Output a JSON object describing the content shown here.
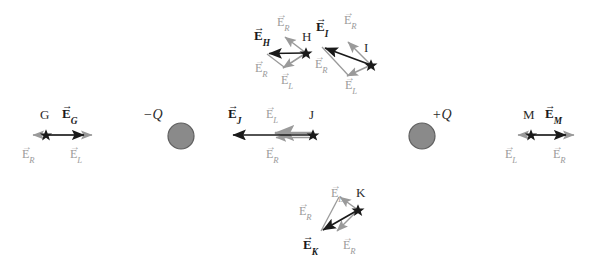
{
  "figure": {
    "type": "physics-vector-diagram",
    "background_color": "#ffffff",
    "black_color": "#1a1a1a",
    "gray_color": "#9a9a9a",
    "charge_fill_color": "#8a8a8a",
    "charge_border_color": "#5f5f5f"
  },
  "charges": [
    {
      "name": "negative-charge",
      "label": "−Q",
      "cx": 181,
      "cy": 136,
      "r": 13,
      "label_x": 143,
      "label_y": 110
    },
    {
      "name": "positive-charge",
      "label": "+Q",
      "cx": 422,
      "cy": 136,
      "r": 13,
      "label_x": 433,
      "label_y": 110
    }
  ],
  "points": [
    {
      "id": "G",
      "point_label": "G",
      "resultant_label": {
        "base": "E",
        "sub": "G"
      },
      "component_labels": [
        {
          "base": "E",
          "sub": "R"
        },
        {
          "base": "E",
          "sub": "L"
        }
      ],
      "star_x": 46,
      "star_y": 135
    },
    {
      "id": "H",
      "point_label": "H",
      "resultant_label": {
        "base": "E",
        "sub": "H"
      },
      "component_labels": [
        {
          "base": "E",
          "sub": "R"
        },
        {
          "base": "E",
          "sub": "L"
        },
        {
          "base": "E",
          "sub": "R"
        }
      ],
      "star_x": 306,
      "star_y": 53
    },
    {
      "id": "I",
      "point_label": "I",
      "resultant_label": {
        "base": "E",
        "sub": "I"
      },
      "component_labels": [
        {
          "base": "E",
          "sub": "R"
        },
        {
          "base": "E",
          "sub": "L"
        },
        {
          "base": "E",
          "sub": "R"
        }
      ],
      "star_x": 371,
      "star_y": 65
    },
    {
      "id": "J",
      "point_label": "J",
      "resultant_label": {
        "base": "E",
        "sub": "J"
      },
      "component_labels": [
        {
          "base": "E",
          "sub": "L"
        },
        {
          "base": "E",
          "sub": "R"
        }
      ],
      "star_x": 313,
      "star_y": 135
    },
    {
      "id": "K",
      "point_label": "K",
      "resultant_label": {
        "base": "E",
        "sub": "K"
      },
      "component_labels": [
        {
          "base": "E",
          "sub": "L"
        },
        {
          "base": "E",
          "sub": "R"
        },
        {
          "base": "E",
          "sub": "R"
        }
      ],
      "star_x": 358,
      "star_y": 210
    },
    {
      "id": "M",
      "point_label": "M",
      "resultant_label": {
        "base": "E",
        "sub": "M"
      },
      "component_labels": [
        {
          "base": "E",
          "sub": "L"
        },
        {
          "base": "E",
          "sub": "R"
        }
      ],
      "star_x": 531,
      "star_y": 135
    }
  ],
  "labels": {
    "g_point": "G",
    "g_resultant_base": "E",
    "g_resultant_sub": "G",
    "g_er": "E",
    "g_er_sub": "R",
    "g_el": "E",
    "g_el_sub": "L",
    "h_point": "H",
    "h_resultant_base": "E",
    "h_resultant_sub": "H",
    "h_er_top": "E",
    "h_er_top_sub": "R",
    "h_er_left": "E",
    "h_er_left_sub": "R",
    "h_el": "E",
    "h_el_sub": "L",
    "i_point": "I",
    "i_resultant_base": "E",
    "i_resultant_sub": "I",
    "i_er_top": "E",
    "i_er_top_sub": "R",
    "i_er_left": "E",
    "i_er_left_sub": "R",
    "i_el": "E",
    "i_el_sub": "L",
    "j_point": "J",
    "j_resultant_base": "E",
    "j_resultant_sub": "J",
    "j_el": "E",
    "j_el_sub": "L",
    "j_er": "E",
    "j_er_sub": "R",
    "k_point": "K",
    "k_resultant_base": "E",
    "k_resultant_sub": "K",
    "k_el": "E",
    "k_el_sub": "L",
    "k_er_left": "E",
    "k_er_left_sub": "R",
    "k_er_bottom": "E",
    "k_er_bottom_sub": "R",
    "m_point": "M",
    "m_resultant_base": "E",
    "m_resultant_sub": "M",
    "m_el": "E",
    "m_el_sub": "L",
    "m_er": "E",
    "m_er_sub": "R",
    "neg_charge": "−Q",
    "pos_charge": "+Q",
    "harpoon": "→"
  }
}
